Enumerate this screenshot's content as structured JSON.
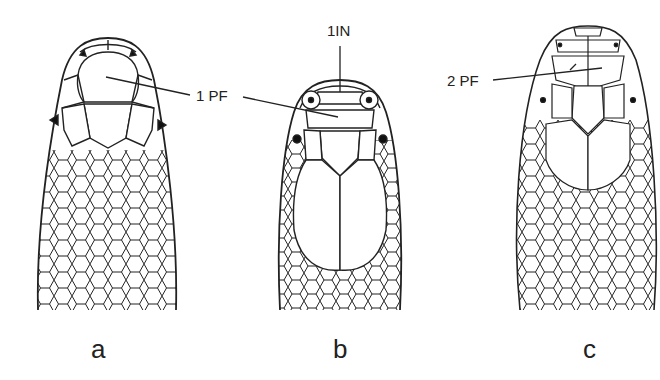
{
  "figure": {
    "panels": [
      {
        "id": "a",
        "label": "a",
        "callout": "1 PF"
      },
      {
        "id": "b",
        "label": "b",
        "callouts": [
          "1IN",
          "1 PF"
        ]
      },
      {
        "id": "c",
        "label": "c",
        "callout": "2 PF"
      }
    ],
    "callouts": {
      "one_pf": "1 PF",
      "one_in": "1IN",
      "two_pf": "2 PF"
    },
    "panel_labels": {
      "a": "a",
      "b": "b",
      "c": "c"
    },
    "colors": {
      "line": "#222222",
      "background": "#ffffff"
    }
  }
}
